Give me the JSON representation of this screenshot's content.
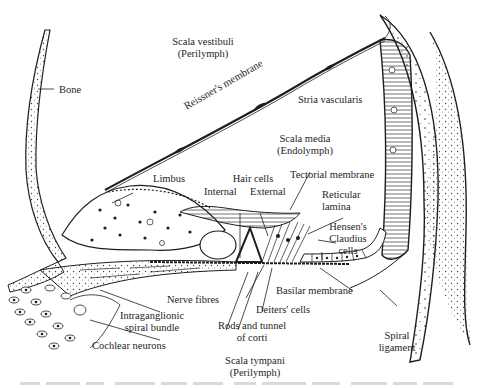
{
  "figure": {
    "labels": {
      "bone": "Bone",
      "scala_vestibuli": "Scala vestibuli",
      "scala_vestibuli_fluid": "(Perilymph)",
      "reissners_membrane": "Reissner's membrane",
      "stria_vascularis": "Stria vascularis",
      "scala_media": "Scala media",
      "scala_media_fluid": "(Endolymph)",
      "limbus": "Limbus",
      "hair_cells": "Hair cells",
      "hair_cells_internal": "Internal",
      "hair_cells_external": "External",
      "tectorial_membrane": "Tectorial membrane",
      "reticular_lamina_1": "Reticular",
      "reticular_lamina_2": "lamina",
      "hensens_claudius_1": "Hensen's",
      "hensens_claudius_2": "Claudius",
      "hensens_claudius_3": "cells",
      "basilar_membrane": "Basilar membrane",
      "nerve_fibres": "Nerve fibres",
      "deiters_cells": "Deiters' cells",
      "intraganglionic_1": "Intraganglionic",
      "intraganglionic_2": "spiral bundle",
      "rods_tunnel_1": "Rods and tunnel",
      "rods_tunnel_2": "of corti",
      "spiral_ligament_1": "Spiral",
      "spiral_ligament_2": "ligament",
      "cochlear_neurons": "Cochlear neurons",
      "scala_tympani": "Scala tympani",
      "scala_tympani_fluid": "(Perilymph)"
    },
    "caption_visible": false
  },
  "colors": {
    "ink": "#1e1e1e",
    "paper": "#ffffff",
    "stipple": "#555555"
  }
}
